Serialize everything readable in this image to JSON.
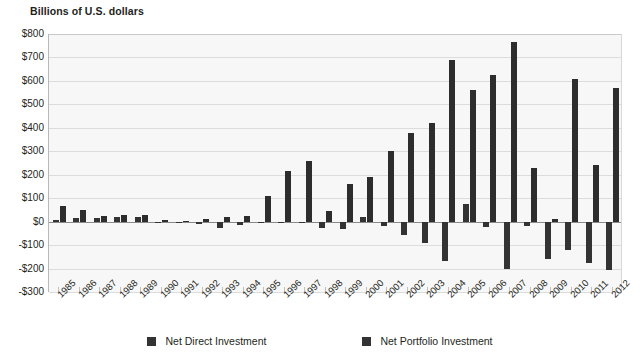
{
  "axis_title": "Billions of U.S. dollars",
  "legend": {
    "items": [
      {
        "label": "Net Direct Investment",
        "color": "#333333",
        "key": "direct"
      },
      {
        "label": "Net Portfolio Investment",
        "color": "#333333",
        "key": "portfolio"
      }
    ]
  },
  "colors": {
    "background": "#ffffff",
    "plot_background": "#f7f7f7",
    "gridline": "#dcdcdc",
    "zero_line": "#8a8a8a",
    "bar_direct": "#333333",
    "bar_portfolio": "#2d2d2d",
    "text": "#231f20"
  },
  "chart_data": {
    "type": "bar",
    "title": "",
    "subtitle": "",
    "xlabel": "",
    "ylabel": "Billions of U.S. dollars",
    "ylim": [
      -300,
      800
    ],
    "ytick_step": 100,
    "ytick_labels": [
      "$800",
      "$700",
      "$600",
      "$500",
      "$400",
      "$300",
      "$200",
      "$100",
      "$0",
      "-$100",
      "-$200",
      "-$300"
    ],
    "ytick_values": [
      800,
      700,
      600,
      500,
      400,
      300,
      200,
      100,
      0,
      -100,
      -200,
      -300
    ],
    "grid": true,
    "legend_position": "bottom",
    "categories": [
      "1985",
      "1986",
      "1987",
      "1988",
      "1989",
      "1990",
      "1991",
      "1992",
      "1993",
      "1994",
      "1995",
      "1996",
      "1997",
      "1998",
      "1999",
      "2000",
      "2001",
      "2002",
      "2003",
      "2004",
      "2005",
      "2006",
      "2007",
      "2008",
      "2009",
      "2010",
      "2011",
      "2012"
    ],
    "series": [
      {
        "name": "Net Direct Investment",
        "color": "#333333",
        "values": [
          5,
          15,
          15,
          20,
          20,
          -3,
          -1,
          -12,
          -27,
          -16,
          -1,
          -1,
          -4,
          -26,
          -30,
          20,
          -20,
          -55,
          -90,
          -170,
          75,
          -25,
          -200,
          -20,
          -160,
          -120,
          -175,
          -205
        ]
      },
      {
        "name": "Net Portfolio Investment",
        "color": "#2d2d2d",
        "values": [
          68,
          48,
          26,
          30,
          28,
          8,
          2,
          13,
          20,
          22,
          110,
          215,
          260,
          45,
          160,
          190,
          300,
          380,
          420,
          690,
          560,
          625,
          765,
          230,
          10,
          610,
          240,
          570
        ]
      }
    ]
  }
}
